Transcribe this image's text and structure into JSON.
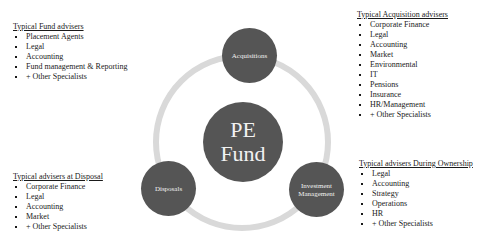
{
  "diagram": {
    "center": {
      "line1": "PE",
      "line2": "Fund"
    },
    "nodes": [
      {
        "id": "acquisitions",
        "label": "Acquisitions"
      },
      {
        "id": "investment-management",
        "line1": "Investment",
        "line2": "Management"
      },
      {
        "id": "disposals",
        "label": "Disposals"
      }
    ],
    "colors": {
      "node": "#555555",
      "ring": "#d9d9d9",
      "node_text": "#f2f2f2"
    }
  },
  "blocks": {
    "fund": {
      "title": "Typical Fund advisers",
      "items": [
        "Placement Agents",
        "Legal",
        "Accounting",
        "Fund management & Reporting",
        "+ Other Specialists"
      ]
    },
    "acquisition": {
      "title": "Typical Acquisition advisers",
      "items": [
        "Corporate Finance",
        "Legal",
        "Accounting",
        "Market",
        "Environmental",
        "IT",
        "Pensions",
        "Insurance",
        "HR/Management",
        "+ Other Specialists"
      ]
    },
    "disposal": {
      "title": "Typical advisers at Disposal",
      "items": [
        "Corporate Finance",
        "Legal",
        "Accounting",
        "Market",
        "+ Other Specialists"
      ]
    },
    "ownership": {
      "title": "Typical advisers During Ownership",
      "items": [
        "Legal",
        "Accounting",
        "Strategy",
        "Operations",
        "HR",
        "+ Other Specialists"
      ]
    }
  }
}
